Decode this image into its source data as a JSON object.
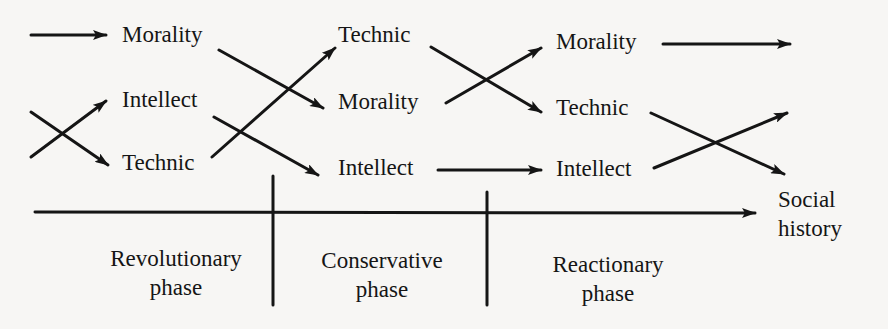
{
  "diagram": {
    "type": "phase-cycle",
    "colors": {
      "ink": "#151515",
      "paper": "#f7f6f4"
    },
    "columns": [
      {
        "id": "col1",
        "items": [
          "Morality",
          "Intellect",
          "Technic"
        ]
      },
      {
        "id": "col2",
        "items": [
          "Technic",
          "Morality",
          "Intellect"
        ]
      },
      {
        "id": "col3",
        "items": [
          "Morality",
          "Technic",
          "Intellect"
        ]
      }
    ],
    "axis": {
      "label_line1": "Social",
      "label_line2": "history"
    },
    "phases": [
      {
        "line1": "Revolutionary",
        "line2": "phase"
      },
      {
        "line1": "Conservative",
        "line2": "phase"
      },
      {
        "line1": "Reactionary",
        "line2": "phase"
      }
    ],
    "transitions": [
      {
        "from": "col1.Morality",
        "to": "col2.Morality"
      },
      {
        "from": "col1.Intellect",
        "to": "col2.Intellect"
      },
      {
        "from": "col1.Technic",
        "to": "col2.Technic"
      },
      {
        "from": "col2.Technic",
        "to": "col3.Technic"
      },
      {
        "from": "col2.Morality",
        "to": "col3.Morality"
      },
      {
        "from": "col2.Intellect",
        "to": "col3.Intellect"
      }
    ]
  }
}
